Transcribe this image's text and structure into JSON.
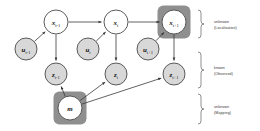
{
  "diagram": {
    "colors": {
      "state_fill": "#ffffff",
      "control_fill": "#d8d8d8",
      "observation_fill": "#d8d8d8",
      "map_fill": "#ffffff",
      "highlight_fill": "#8f8f8f",
      "node_stroke": "#4a4a4a",
      "edge": "#3a3a3a",
      "brace": "#6b6b6b",
      "label_text": "#333333"
    },
    "nodes": [
      {
        "id": "x_tm1",
        "base": "x",
        "sub": "t-1",
        "row": "state",
        "cx": 56,
        "cy": 22,
        "r": 12,
        "fill": "#ffffff",
        "highlight": false
      },
      {
        "id": "x_t",
        "base": "x",
        "sub": "t",
        "row": "state",
        "cx": 116,
        "cy": 22,
        "r": 12,
        "fill": "#ffffff",
        "highlight": false
      },
      {
        "id": "x_tp1",
        "base": "x",
        "sub": "t+1",
        "row": "state",
        "cx": 174,
        "cy": 22,
        "r": 12,
        "fill": "#ffffff",
        "highlight": true
      },
      {
        "id": "u_tm1",
        "base": "u",
        "sub": "t-1",
        "row": "control",
        "cx": 26,
        "cy": 49,
        "r": 11,
        "fill": "#d8d8d8",
        "highlight": false
      },
      {
        "id": "u_t",
        "base": "u",
        "sub": "t",
        "row": "control",
        "cx": 88,
        "cy": 49,
        "r": 11,
        "fill": "#d8d8d8",
        "highlight": false
      },
      {
        "id": "u_tp1",
        "base": "u",
        "sub": "t+1",
        "row": "control",
        "cx": 148,
        "cy": 49,
        "r": 11,
        "fill": "#d8d8d8",
        "highlight": false
      },
      {
        "id": "z_tm1",
        "base": "z",
        "sub": "t-1",
        "row": "observation",
        "cx": 56,
        "cy": 74,
        "r": 11,
        "fill": "#d8d8d8",
        "highlight": false
      },
      {
        "id": "z_t",
        "base": "z",
        "sub": "t",
        "row": "observation",
        "cx": 116,
        "cy": 74,
        "r": 11,
        "fill": "#d8d8d8",
        "highlight": false
      },
      {
        "id": "z_tp1",
        "base": "z",
        "sub": "t+1",
        "row": "observation",
        "cx": 174,
        "cy": 74,
        "r": 11,
        "fill": "#d8d8d8",
        "highlight": false
      },
      {
        "id": "m",
        "base": "m",
        "sub": "",
        "row": "map",
        "cx": 70,
        "cy": 108,
        "r": 12,
        "fill": "#ffffff",
        "highlight": true
      }
    ],
    "edges": [
      {
        "from": "x_tm1",
        "to": "x_t",
        "kind": "transition"
      },
      {
        "from": "x_t",
        "to": "x_tp1",
        "kind": "transition"
      },
      {
        "from": "u_tm1",
        "to": "x_tm1",
        "kind": "control"
      },
      {
        "from": "u_t",
        "to": "x_t",
        "kind": "control"
      },
      {
        "from": "u_tp1",
        "to": "x_tp1",
        "kind": "control"
      },
      {
        "from": "x_tm1",
        "to": "z_tm1",
        "kind": "measurement"
      },
      {
        "from": "x_t",
        "to": "z_t",
        "kind": "measurement"
      },
      {
        "from": "x_tp1",
        "to": "z_tp1",
        "kind": "measurement"
      },
      {
        "from": "m",
        "to": "z_tm1",
        "kind": "map-measurement"
      },
      {
        "from": "m",
        "to": "z_t",
        "kind": "map-measurement"
      },
      {
        "from": "m",
        "to": "z_tp1",
        "kind": "map-measurement"
      }
    ],
    "legend": [
      {
        "id": "legend-localisation",
        "line1": "unknown",
        "line2": "(Localisation)",
        "y_top": 10,
        "y_bottom": 38
      },
      {
        "id": "legend-observed",
        "line1": "known",
        "line2": "(Observed)",
        "y_top": 52,
        "y_bottom": 88
      },
      {
        "id": "legend-mapping",
        "line1": "unknown",
        "line2": "(Mapping)",
        "y_top": 94,
        "y_bottom": 124
      }
    ]
  }
}
